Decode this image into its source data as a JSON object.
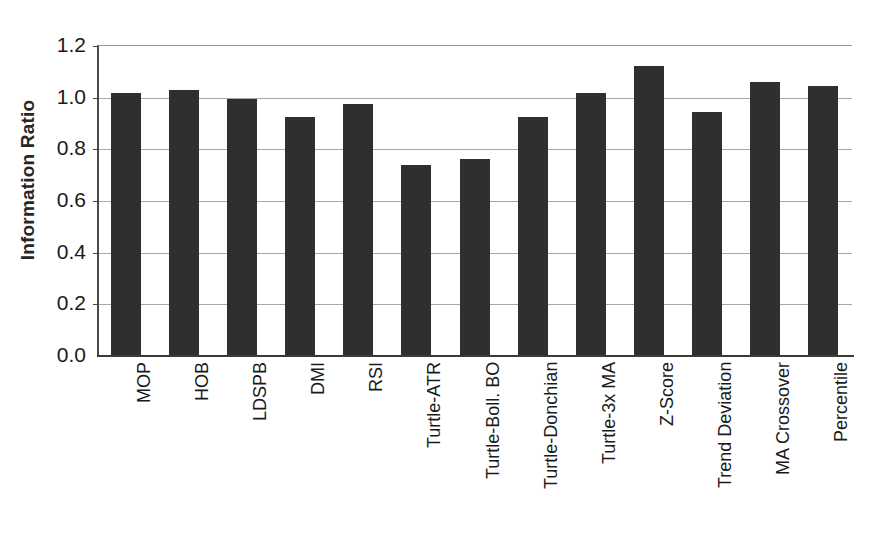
{
  "chart_data": {
    "type": "bar",
    "title": "",
    "subtitle": "",
    "xlabel": "",
    "ylabel": "Information Ratio",
    "ylim": [
      0.0,
      1.2
    ],
    "yticks": [
      "0.0",
      "0.2",
      "0.4",
      "0.6",
      "0.8",
      "1.0",
      "1.2"
    ],
    "ytick_values": [
      0.0,
      0.2,
      0.4,
      0.6,
      0.8,
      1.0,
      1.2
    ],
    "grid": true,
    "legend": null,
    "legend_position": "none",
    "bar_color": "#2f2f2f",
    "categories": [
      "MOP",
      "HOB",
      "LDSPB",
      "DMI",
      "RSI",
      "Turtle-ATR",
      "Turtle-Boll. BO",
      "Turtle-Donchian",
      "Turtle-3x MA",
      "Z-Score",
      "Trend Deviation",
      "MA Crossover",
      "Percentile"
    ],
    "values": [
      1.015,
      1.025,
      0.99,
      0.92,
      0.97,
      0.735,
      0.76,
      0.92,
      1.015,
      1.12,
      0.94,
      1.055,
      1.04
    ]
  }
}
